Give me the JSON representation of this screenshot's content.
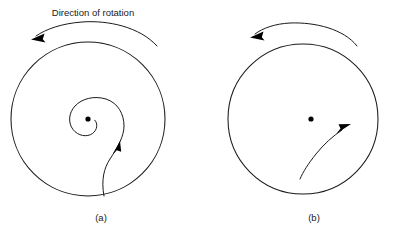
{
  "figure": {
    "background_color": "#ffffff",
    "stroke_color": "#1a1a1a",
    "dot_color": "#000000",
    "width": 405,
    "height": 228
  },
  "annotation": {
    "rotation_caption": "Direction of rotation"
  },
  "panels": [
    {
      "id": "a",
      "label": "(a)",
      "circle": {
        "cx": 88,
        "cy": 119,
        "r": 77
      },
      "center_dot": {
        "cx": 88,
        "cy": 119,
        "r": 2.6
      },
      "path_type": "spiral",
      "path_description": "spiral curve winding inward counterclockwise toward center dot",
      "path_arrow_direction": "up-right",
      "rotation_arrow": {
        "direction": "counterclockwise",
        "arrowhead_side": "left"
      }
    },
    {
      "id": "b",
      "label": "(b)",
      "circle": {
        "cx": 303,
        "cy": 119,
        "r": 75
      },
      "center_dot": {
        "cx": 311,
        "cy": 119,
        "r": 2.6
      },
      "path_type": "gentle-curve",
      "path_description": "nearly straight gently curved path from lower-left to upper-right, not reaching center",
      "path_arrow_direction": "up-right",
      "rotation_arrow": {
        "direction": "counterclockwise",
        "arrowhead_side": "left"
      }
    }
  ]
}
